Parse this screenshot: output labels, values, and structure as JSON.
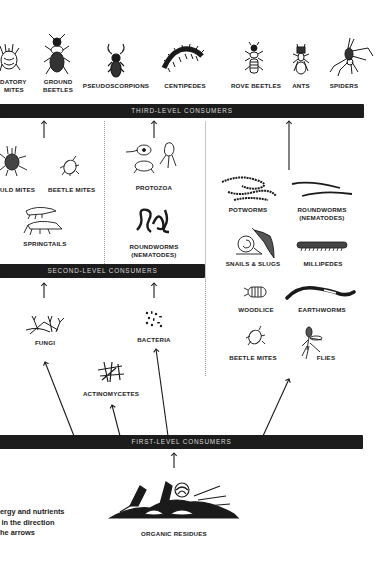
{
  "diagram": {
    "type": "soil food web",
    "bands": {
      "third": "THIRD-LEVEL CONSUMERS",
      "second": "SECOND-LEVEL CONSUMERS",
      "first": "FIRST-LEVEL CONSUMERS"
    },
    "top_organisms": [
      {
        "label_line1": "DATORY",
        "label_line2": "MITES",
        "icon": "predatory-mite-icon"
      },
      {
        "label_line1": "GROUND",
        "label_line2": "BEETLES",
        "icon": "ground-beetle-icon"
      },
      {
        "label_line1": "PSEUDOSCORPIONS",
        "icon": "pseudoscorpion-icon"
      },
      {
        "label_line1": "CENTIPEDES",
        "icon": "centipede-icon"
      },
      {
        "label_line1": "ROVE BEETLES",
        "icon": "rove-beetle-icon"
      },
      {
        "label_line1": "ANTS",
        "icon": "ant-icon"
      },
      {
        "label_line1": "SPIDERS",
        "icon": "spider-icon"
      }
    ],
    "second_level": {
      "left": [
        {
          "label": "ULD MITES",
          "icon": "mold-mite-icon"
        },
        {
          "label": "BEETLE MITES",
          "icon": "beetle-mite-icon"
        },
        {
          "label": "SPRINGTAILS",
          "icon": "springtail-icon"
        }
      ],
      "middle": [
        {
          "label": "PROTOZOA",
          "icon": "protozoa-icon"
        },
        {
          "label_line1": "ROUNDWORMS",
          "label_line2": "(NEMATODES)",
          "icon": "roundworm-icon"
        }
      ]
    },
    "right_column": [
      {
        "label": "POTWORMS",
        "icon": "potworm-icon"
      },
      {
        "label_line1": "ROUNDWORMS",
        "label_line2": "(NEMATODES)",
        "icon": "roundworm-icon"
      },
      {
        "label": "SNAILS & SLUGS",
        "icon": "snail-slug-icon"
      },
      {
        "label": "MILLIPEDES",
        "icon": "millipede-icon"
      },
      {
        "label": "WOODLICE",
        "icon": "woodlouse-icon"
      },
      {
        "label": "EARTHWORMS",
        "icon": "earthworm-icon"
      },
      {
        "label": "BEETLE MITES",
        "icon": "beetle-mite-icon"
      },
      {
        "label": "FLIES",
        "icon": "fly-icon"
      }
    ],
    "first_level": [
      {
        "label": "FUNGI",
        "icon": "fungi-icon"
      },
      {
        "label": "BACTERIA",
        "icon": "bacteria-icon"
      },
      {
        "label": "ACTINOMYCETES",
        "icon": "actinomycetes-icon"
      }
    ],
    "base": {
      "label": "ORGANIC RESIDUES",
      "icon": "organic-residues-icon"
    },
    "note": {
      "line1": "ergy and nutrients",
      "line2": " in the direction",
      "line3": "he arrows"
    },
    "colors": {
      "band": "#1c1c1c",
      "band_text": "#d8d8d8",
      "ink": "#1a1a1a",
      "background": "#ffffff"
    }
  }
}
